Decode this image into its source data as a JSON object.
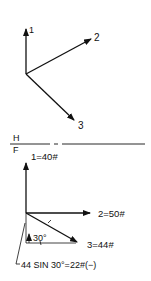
{
  "top_view": {
    "label": "H",
    "vectors": [
      {
        "id": "1",
        "label": "1"
      },
      {
        "id": "2",
        "label": "2"
      },
      {
        "id": "3",
        "label": "3"
      }
    ]
  },
  "fold_line": {
    "upper": "H",
    "lower": "F"
  },
  "front_view": {
    "label": "F",
    "vectors": [
      {
        "id": "1",
        "label": "1=40#"
      },
      {
        "id": "2",
        "label": "2=50#"
      },
      {
        "id": "3",
        "label": "3=44#"
      }
    ],
    "angle_label": "30°",
    "component_note": "44 SIN 30°=22#(−)"
  }
}
